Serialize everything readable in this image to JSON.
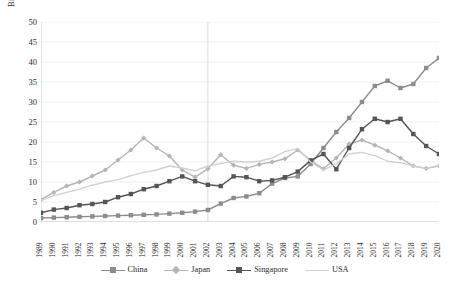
{
  "chart_data": {
    "type": "line",
    "title": "",
    "subtitle": "",
    "xlabel": "",
    "ylabel": "Billions",
    "ylim": [
      0,
      50
    ],
    "ytick_step": 5,
    "yticks": [
      0,
      5,
      10,
      15,
      20,
      25,
      30,
      35,
      40,
      45,
      50
    ],
    "grid": "horizontal",
    "legend_position": "bottom",
    "categories": [
      "1989",
      "1990",
      "1991",
      "1992",
      "1993",
      "1994",
      "1995",
      "1996",
      "1997",
      "1998",
      "1999",
      "2000",
      "2001",
      "2002",
      "2003",
      "2004",
      "2005",
      "2006",
      "2007",
      "2008",
      "2009",
      "2010",
      "2011",
      "2012",
      "2013",
      "2014",
      "2015",
      "2016",
      "2017",
      "2018",
      "2019",
      "2020"
    ],
    "series": [
      {
        "name": "China",
        "color": "#8c8c8c",
        "marker": "square",
        "values": [
          1.0,
          1.1,
          1.2,
          1.3,
          1.4,
          1.5,
          1.6,
          1.7,
          1.8,
          1.9,
          2.1,
          2.3,
          2.6,
          3.0,
          4.6,
          6.0,
          6.4,
          7.2,
          9.6,
          11.0,
          11.4,
          14.5,
          18.5,
          22.5,
          26.0,
          30.0,
          34.0,
          35.3,
          33.5,
          34.5,
          38.5,
          41.0
        ],
        "note": "Values estimated from plotted points"
      },
      {
        "name": "Japan",
        "color": "#b5b5b5",
        "marker": "diamond",
        "values": [
          5.6,
          7.4,
          9.0,
          10.0,
          11.5,
          13.0,
          15.5,
          18.0,
          21.0,
          18.5,
          16.5,
          13.0,
          11.2,
          13.3,
          16.8,
          14.2,
          13.4,
          14.4,
          15.0,
          15.8,
          18.0,
          15.4,
          13.3,
          16.0,
          19.5,
          20.5,
          19.2,
          17.8,
          16.0,
          14.0,
          13.4,
          14.0
        ],
        "note": "Values estimated from plotted points"
      },
      {
        "name": "Singapore",
        "color": "#555555",
        "marker": "square",
        "values": [
          2.3,
          3.1,
          3.5,
          4.2,
          4.5,
          5.0,
          6.2,
          7.0,
          8.2,
          9.0,
          10.2,
          11.4,
          10.2,
          9.3,
          9.0,
          11.4,
          11.2,
          10.2,
          10.4,
          11.2,
          12.6,
          15.4,
          17.0,
          13.2,
          18.5,
          23.2,
          25.8,
          25.0,
          25.8,
          22.0,
          19.0,
          17.0
        ],
        "note": "Values estimated from plotted points"
      },
      {
        "name": "USA",
        "color": "#d2d2d2",
        "marker": "none",
        "values": [
          5.4,
          6.6,
          7.4,
          8.2,
          9.2,
          10.0,
          10.6,
          11.6,
          12.4,
          13.0,
          14.0,
          13.5,
          12.8,
          14.0,
          14.6,
          15.2,
          15.0,
          15.2,
          16.0,
          17.6,
          18.4,
          15.0,
          13.0,
          14.6,
          17.0,
          17.4,
          16.6,
          15.2,
          14.8,
          14.0,
          13.4,
          14.2
        ],
        "note": "Values estimated from plotted points"
      }
    ],
    "legend": [
      "China",
      "Japan",
      "Singapore",
      "USA"
    ],
    "annotations": {
      "vertical_marker_year": "2002"
    }
  },
  "colors": {
    "background": "#ffffff",
    "grid": "#ececec",
    "axis": "#bfbfbf",
    "text": "#2b2b2b",
    "vertical_marker": "#d8d8d8"
  }
}
